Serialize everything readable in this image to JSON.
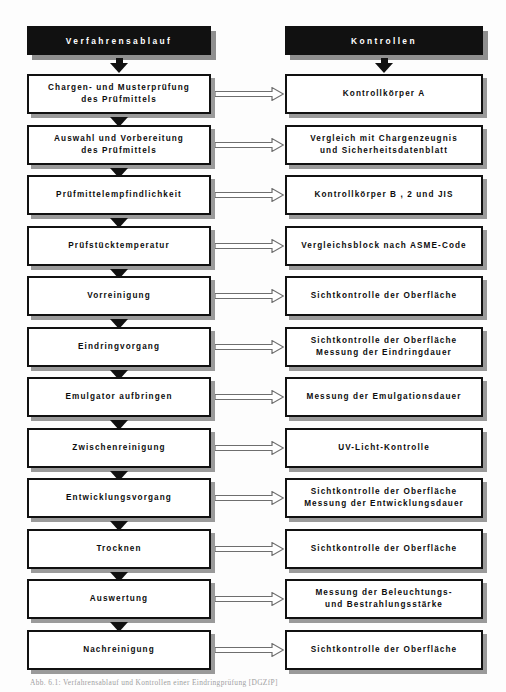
{
  "diagram": {
    "title_left": "Verfahrensablauf",
    "title_right": "Kontrollen",
    "caption": "Abb. 6.1: Verfahrensablauf und Kontrollen einer Eindringprüfung [DGZfP]",
    "colors": {
      "header_fill": "#111111",
      "header_text": "#ffffff",
      "box_fill": "#ffffff",
      "box_border": "#111111",
      "shadow": "#9a9a9a",
      "vertical_arrow": "#111111",
      "horizontal_arrow_outline": "#6e6e6e",
      "page_background": "#fdfdfd"
    },
    "rows": [
      {
        "left_line1": "Chargen- und Musterprüfung",
        "left_line2": "des  Prüfmittels",
        "right_line1": "Kontrollkörper A",
        "right_line2": ""
      },
      {
        "left_line1": "Auswahl und Vorbereitung",
        "left_line2": "des Prüfmittels",
        "right_line1": "Vergleich mit Chargenzeugnis",
        "right_line2": "und Sicherheitsdatenblatt"
      },
      {
        "left_line1": "Prüfmittelempfindlichkeit",
        "left_line2": "",
        "right_line1": "Kontrollkörper B , 2 und  JIS",
        "right_line2": ""
      },
      {
        "left_line1": "Prüfstücktemperatur",
        "left_line2": "",
        "right_line1": "Vergleichsblock nach ASME-Code",
        "right_line2": ""
      },
      {
        "left_line1": "Vorreinigung",
        "left_line2": "",
        "right_line1": "Sichtkontrolle der Oberfläche",
        "right_line2": ""
      },
      {
        "left_line1": "Eindringvorgang",
        "left_line2": "",
        "right_line1": "Sichtkontrolle der Oberfläche",
        "right_line2": "Messung der Eindringdauer"
      },
      {
        "left_line1": "Emulgator aufbringen",
        "left_line2": "",
        "right_line1": "Messung der Emulgationsdauer",
        "right_line2": ""
      },
      {
        "left_line1": "Zwischenreinigung",
        "left_line2": "",
        "right_line1": "UV-Licht-Kontrolle",
        "right_line2": ""
      },
      {
        "left_line1": "Entwicklungsvorgang",
        "left_line2": "",
        "right_line1": "Sichtkontrolle der Oberfläche",
        "right_line2": "Messung der Entwicklungsdauer"
      },
      {
        "left_line1": "Trocknen",
        "left_line2": "",
        "right_line1": "Sichtkontrolle der Oberfläche",
        "right_line2": ""
      },
      {
        "left_line1": "Auswertung",
        "left_line2": "",
        "right_line1": "Messung der Beleuchtungs-",
        "right_line2": "und Bestrahlungsstärke"
      },
      {
        "left_line1": "Nachreinigung",
        "left_line2": "",
        "right_line1": "Sichtkontrolle der Oberfläche",
        "right_line2": ""
      }
    ]
  }
}
